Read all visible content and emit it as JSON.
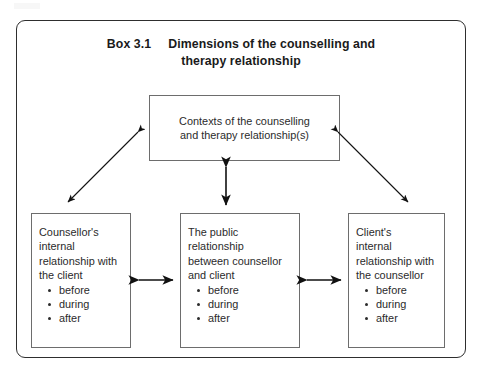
{
  "figure": {
    "title": {
      "box_number": "Box 3.1",
      "line_1": "Dimensions of the counselling and",
      "line_2": "therapy relationship"
    },
    "nodes": {
      "contexts": {
        "id": "contexts-of-the-counselling-and-therapy-relationships",
        "line_1": "Contexts of the counselling",
        "line_2": "and therapy relationship(s)"
      },
      "counsellor": {
        "id": "counsellors-internal-relationship-with-the-client",
        "line_1": "Counsellor's",
        "line_2": "internal",
        "line_3": "relationship with",
        "line_4": "the client",
        "bullets": [
          "before",
          "during",
          "after"
        ]
      },
      "public": {
        "id": "the-public-relationship-between-counsellor-and-client",
        "line_1": "The public",
        "line_2": "relationship",
        "line_3": "between counsellor",
        "line_4": "and client",
        "bullets": [
          "before",
          "during",
          "after"
        ]
      },
      "client": {
        "id": "clients-internal-relationship-with-the-counsellor",
        "line_1": "Client's",
        "line_2": "internal",
        "line_3": "relationship with",
        "line_4": "the counsellor",
        "bullets": [
          "before",
          "during",
          "after"
        ]
      }
    },
    "connectors": [
      {
        "name": "contexts-to-counsellor",
        "style": "double-headed-diagonal"
      },
      {
        "name": "contexts-to-client",
        "style": "double-headed-diagonal"
      },
      {
        "name": "contexts-to-public",
        "style": "double-headed-vertical"
      },
      {
        "name": "counsellor-to-public",
        "style": "double-headed-horizontal"
      },
      {
        "name": "public-to-client",
        "style": "double-headed-horizontal"
      }
    ],
    "colors": {
      "frame_border": "#2e2e2e",
      "node_border": "#6d6d6d",
      "text": "#2b2b2b",
      "arrow": "#111111",
      "background": "#ffffff"
    }
  }
}
